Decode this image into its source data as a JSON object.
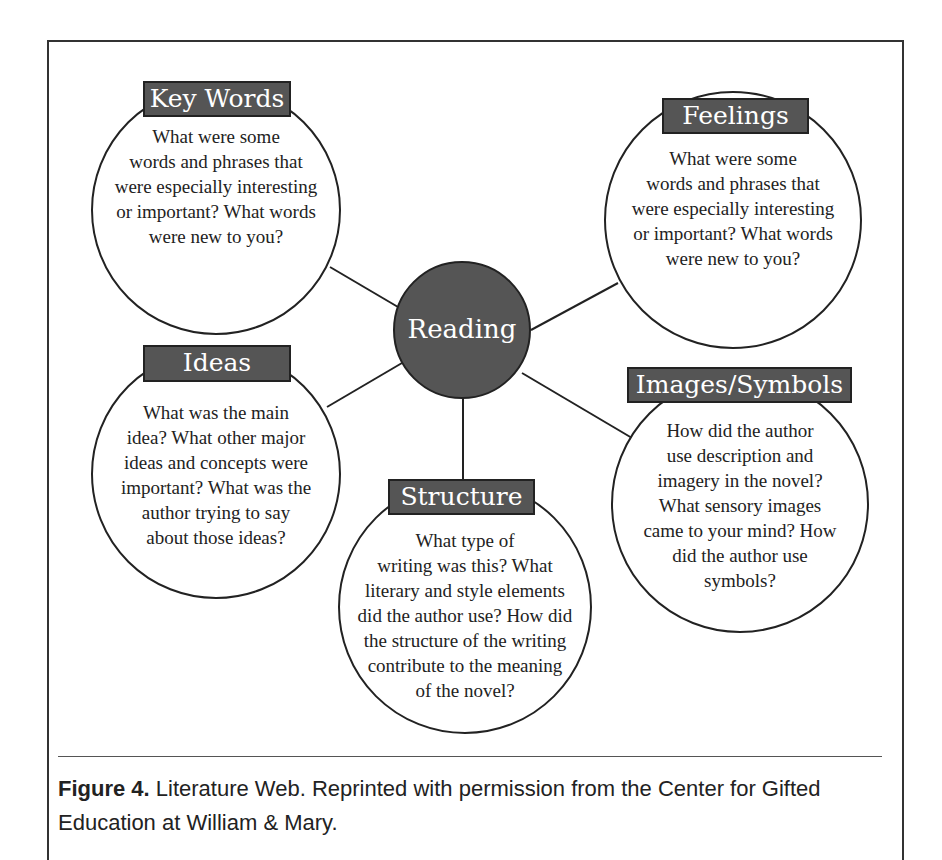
{
  "diagram": {
    "center": {
      "label": "Reading"
    },
    "nodes": [
      {
        "id": "key-words",
        "label": "Key Words",
        "lines": [
          "What were some",
          "words and phrases that",
          "were especially interesting",
          "or important? What words",
          "were new to you?"
        ]
      },
      {
        "id": "feelings",
        "label": "Feelings",
        "lines": [
          "What were some",
          "words and phrases that",
          "were especially interesting",
          "or important? What words",
          "were new to you?"
        ]
      },
      {
        "id": "ideas",
        "label": "Ideas",
        "lines": [
          "What was the main",
          "idea? What other major",
          "ideas and concepts were",
          "important? What was the",
          "author trying to say",
          "about those ideas?"
        ]
      },
      {
        "id": "images-symbols",
        "label": "Images/Symbols",
        "lines": [
          "How did the author",
          "use description and",
          "imagery in the novel?",
          "What sensory images",
          "came to your mind? How",
          "did the author use",
          "symbols?"
        ]
      },
      {
        "id": "structure",
        "label": "Structure",
        "lines": [
          "What type of",
          "writing was this? What",
          "literary and style elements",
          "did the author use? How did",
          "the structure of the writing",
          "contribute to the meaning",
          "of the novel?"
        ]
      }
    ],
    "colors": {
      "label_fill": "#555555",
      "center_fill": "#555555",
      "stroke": "#222222",
      "text": "#222222"
    }
  },
  "caption": {
    "figure_number": "Figure 4.",
    "text": " Literature Web. Reprinted with permission from the Center for Gifted Education at William & Mary."
  }
}
